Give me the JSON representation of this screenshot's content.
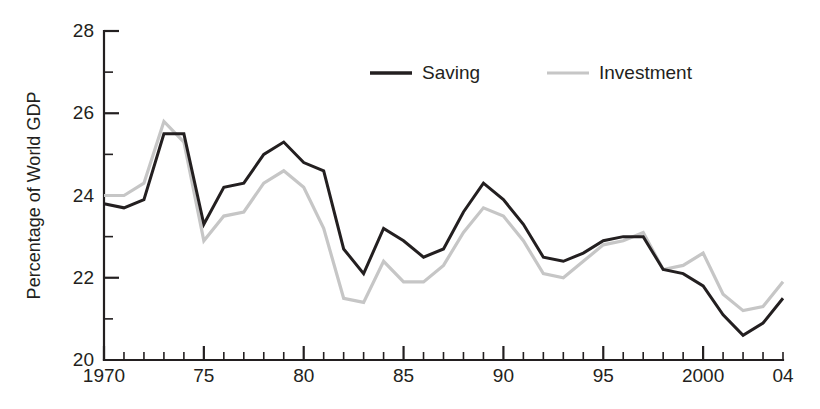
{
  "chart_data": {
    "type": "line",
    "title": "",
    "xlabel": "",
    "ylabel": "Percentage of  World GDP",
    "xlim": [
      1970,
      2004
    ],
    "ylim": [
      20,
      28
    ],
    "grid": false,
    "legend_position": "top-center",
    "y_ticks_major": [
      20,
      22,
      24,
      26,
      28
    ],
    "y_ticks_minor": [
      21,
      23,
      25,
      27
    ],
    "y_tick_labels": [
      "20",
      "22",
      "24",
      "26",
      "28"
    ],
    "x_tick_labels": [
      {
        "x": 1970,
        "label": "1970"
      },
      {
        "x": 1975,
        "label": "75"
      },
      {
        "x": 1980,
        "label": "80"
      },
      {
        "x": 1985,
        "label": "85"
      },
      {
        "x": 1990,
        "label": "90"
      },
      {
        "x": 1995,
        "label": "95"
      },
      {
        "x": 2000,
        "label": "2000"
      },
      {
        "x": 2004,
        "label": "04"
      }
    ],
    "x": [
      1970,
      1971,
      1972,
      1973,
      1974,
      1975,
      1976,
      1977,
      1978,
      1979,
      1980,
      1981,
      1982,
      1983,
      1984,
      1985,
      1986,
      1987,
      1988,
      1989,
      1990,
      1991,
      1992,
      1993,
      1994,
      1995,
      1996,
      1997,
      1998,
      1999,
      2000,
      2001,
      2002,
      2003,
      2004
    ],
    "series": [
      {
        "name": "Saving",
        "color": "#231f20",
        "values": [
          23.8,
          23.7,
          23.9,
          25.5,
          25.5,
          23.3,
          24.2,
          24.3,
          25.0,
          25.3,
          24.8,
          24.6,
          22.7,
          22.1,
          23.2,
          22.9,
          22.5,
          22.7,
          23.6,
          24.3,
          23.9,
          23.3,
          22.5,
          22.4,
          22.6,
          22.9,
          23.0,
          23.0,
          22.2,
          22.1,
          21.8,
          21.1,
          20.6,
          20.9,
          21.5
        ]
      },
      {
        "name": "Investment",
        "color": "#c6c6c6",
        "values": [
          24.0,
          24.0,
          24.3,
          25.8,
          25.3,
          22.9,
          23.5,
          23.6,
          24.3,
          24.6,
          24.2,
          23.2,
          21.5,
          21.4,
          22.4,
          21.9,
          21.9,
          22.3,
          23.1,
          23.7,
          23.5,
          22.9,
          22.1,
          22.0,
          22.4,
          22.8,
          22.9,
          23.1,
          22.2,
          22.3,
          22.6,
          21.6,
          21.2,
          21.3,
          21.9
        ]
      }
    ]
  },
  "legend": {
    "items": [
      {
        "label": "Saving",
        "color": "#231f20"
      },
      {
        "label": "Investment",
        "color": "#c6c6c6"
      }
    ]
  }
}
